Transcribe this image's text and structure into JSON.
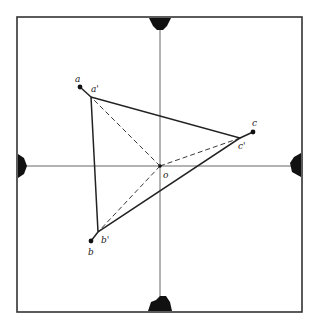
{
  "diagram": {
    "frame": {
      "x": 17,
      "y": 17,
      "width": 285,
      "height": 295,
      "stroke": "#333333"
    },
    "axes": {
      "origin": [
        160,
        166
      ],
      "color": "#555555"
    },
    "origin_label": "o",
    "points": {
      "a": {
        "label": "a",
        "x": 80,
        "y": 87
      },
      "a_prime": {
        "label": "a'",
        "x": 91,
        "y": 97
      },
      "b": {
        "label": "b",
        "x": 91,
        "y": 241
      },
      "b_prime": {
        "label": "b'",
        "x": 98,
        "y": 232
      },
      "c": {
        "label": "c",
        "x": 253,
        "y": 132
      },
      "c_prime": {
        "label": "c'",
        "x": 240,
        "y": 138
      }
    },
    "triangle": [
      "a_prime",
      "b_prime",
      "c_prime"
    ],
    "dashed_rays_from_origin": [
      "a_prime",
      "b_prime",
      "c_prime"
    ],
    "markers": [
      "top",
      "bottom",
      "left",
      "right"
    ],
    "line_color": "#222222"
  }
}
